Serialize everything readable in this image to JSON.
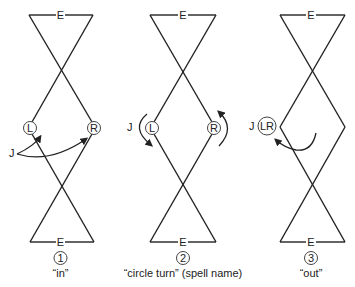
{
  "diagram": {
    "panels": [
      {
        "number": "1",
        "caption": "“in”",
        "top_label": "E",
        "bottom_label": "E",
        "dancers": [
          "L",
          "R"
        ],
        "arrow_label": "J"
      },
      {
        "number": "2",
        "caption": "“circle turn” (spell name)",
        "top_label": "E",
        "bottom_label": "E",
        "dancers": [
          "L",
          "R"
        ],
        "arrow_label": "J"
      },
      {
        "number": "3",
        "caption": "“out”",
        "top_label": "E",
        "bottom_label": "E",
        "dancers": [
          "LR"
        ],
        "arrow_label": "J"
      }
    ]
  }
}
